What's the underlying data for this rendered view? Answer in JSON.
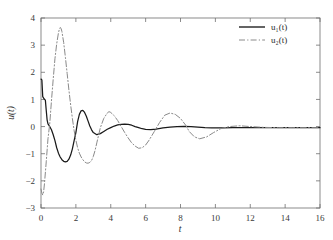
{
  "chart_data": {
    "type": "line",
    "title": "",
    "subtitle": "",
    "xlabel": "t",
    "ylabel": "u(t)",
    "xlim": [
      0,
      16
    ],
    "ylim": [
      -3,
      4
    ],
    "xticks": [
      0,
      2,
      4,
      6,
      8,
      10,
      12,
      14,
      16
    ],
    "yticks": [
      -3,
      -2,
      -1,
      0,
      1,
      2,
      3,
      4
    ],
    "xtick_labels": [
      "0",
      "2",
      "4",
      "6",
      "8",
      "10",
      "12",
      "14",
      "16"
    ],
    "ytick_labels": [
      "−3",
      "−2",
      "−1",
      "0",
      "1",
      "2",
      "3",
      "4"
    ],
    "grid": false,
    "legend_position": "top-right",
    "legend_border": false,
    "colors": {
      "series1": "#1a1a1a",
      "series2": "#8a8a8a",
      "axis": "#6e6e6e",
      "background": "#ffffff"
    },
    "annotations": [],
    "series": [
      {
        "name": "u₁(t)",
        "style": "solid",
        "color": "#1a1a1a",
        "x": [
          0,
          0.05,
          0.1,
          0.15,
          0.2,
          0.25,
          0.3,
          0.35,
          0.4,
          0.45,
          0.5,
          0.6,
          0.7,
          0.8,
          0.9,
          1.0,
          1.1,
          1.2,
          1.3,
          1.4,
          1.5,
          1.6,
          1.7,
          1.8,
          1.9,
          2.0,
          2.1,
          2.2,
          2.3,
          2.4,
          2.5,
          2.6,
          2.7,
          2.8,
          2.9,
          3.0,
          3.2,
          3.4,
          3.6,
          3.8,
          4.0,
          4.2,
          4.4,
          4.6,
          4.8,
          5.0,
          5.2,
          5.4,
          5.6,
          5.8,
          6.0,
          6.3,
          6.6,
          7.0,
          7.4,
          7.8,
          8.2,
          8.6,
          9.0,
          9.4,
          9.8,
          10.4,
          11.0,
          11.6,
          12.2,
          13.0,
          13.8,
          14.6,
          15.4,
          16.0
        ],
        "y": [
          1.75,
          1.72,
          1.1,
          1.05,
          1.0,
          0.98,
          0.6,
          0.25,
          0.1,
          0.05,
          0.0,
          -0.12,
          -0.3,
          -0.52,
          -0.78,
          -0.98,
          -1.12,
          -1.22,
          -1.28,
          -1.3,
          -1.28,
          -1.2,
          -1.05,
          -0.82,
          -0.52,
          -0.22,
          0.18,
          0.45,
          0.58,
          0.6,
          0.52,
          0.38,
          0.2,
          0.02,
          -0.12,
          -0.22,
          -0.3,
          -0.26,
          -0.18,
          -0.1,
          -0.04,
          0.02,
          0.06,
          0.08,
          0.09,
          0.08,
          0.05,
          0.0,
          -0.04,
          -0.08,
          -0.1,
          -0.11,
          -0.09,
          -0.05,
          -0.02,
          0.0,
          0.01,
          0.0,
          -0.02,
          -0.04,
          -0.05,
          -0.05,
          -0.04,
          -0.04,
          -0.04,
          -0.04,
          -0.04,
          -0.04,
          -0.04,
          -0.04
        ]
      },
      {
        "name": "u₂(t)",
        "style": "dash-dot",
        "color": "#8a8a8a",
        "x": [
          0,
          0.05,
          0.1,
          0.15,
          0.2,
          0.3,
          0.4,
          0.5,
          0.6,
          0.7,
          0.8,
          0.9,
          1.0,
          1.05,
          1.1,
          1.15,
          1.2,
          1.3,
          1.4,
          1.5,
          1.6,
          1.7,
          1.8,
          1.9,
          2.0,
          2.1,
          2.2,
          2.3,
          2.4,
          2.5,
          2.6,
          2.7,
          2.8,
          2.9,
          3.0,
          3.1,
          3.2,
          3.4,
          3.6,
          3.8,
          3.9,
          4.0,
          4.2,
          4.4,
          4.6,
          4.8,
          5.0,
          5.2,
          5.4,
          5.6,
          5.8,
          6.0,
          6.2,
          6.5,
          6.8,
          7.1,
          7.4,
          7.7,
          8.0,
          8.3,
          8.5,
          8.8,
          9.1,
          9.5,
          9.9,
          10.3,
          10.8,
          11.4,
          12.0,
          12.8,
          13.6,
          14.4,
          15.2,
          16.0
        ],
        "y": [
          -2.3,
          -2.45,
          -2.52,
          -2.4,
          -2.1,
          -1.3,
          -0.45,
          0.1,
          0.95,
          1.75,
          2.5,
          3.05,
          3.45,
          3.58,
          3.65,
          3.62,
          3.5,
          3.1,
          2.55,
          1.95,
          1.35,
          0.8,
          0.3,
          -0.15,
          -0.5,
          -0.78,
          -0.98,
          -1.12,
          -1.22,
          -1.3,
          -1.34,
          -1.35,
          -1.32,
          -1.25,
          -1.1,
          -0.88,
          -0.6,
          -0.05,
          0.3,
          0.5,
          0.55,
          0.52,
          0.4,
          0.22,
          0.0,
          -0.22,
          -0.42,
          -0.6,
          -0.72,
          -0.8,
          -0.78,
          -0.68,
          -0.5,
          -0.18,
          0.15,
          0.42,
          0.5,
          0.45,
          0.3,
          0.05,
          -0.18,
          -0.38,
          -0.45,
          -0.38,
          -0.22,
          -0.08,
          0.0,
          0.03,
          0.0,
          -0.03,
          -0.04,
          -0.04,
          -0.04,
          -0.04
        ]
      }
    ]
  },
  "legend": {
    "entries": [
      {
        "label": "u₁(t)",
        "style": "solid"
      },
      {
        "label": "u₂(t)",
        "style": "dash-dot"
      }
    ]
  }
}
